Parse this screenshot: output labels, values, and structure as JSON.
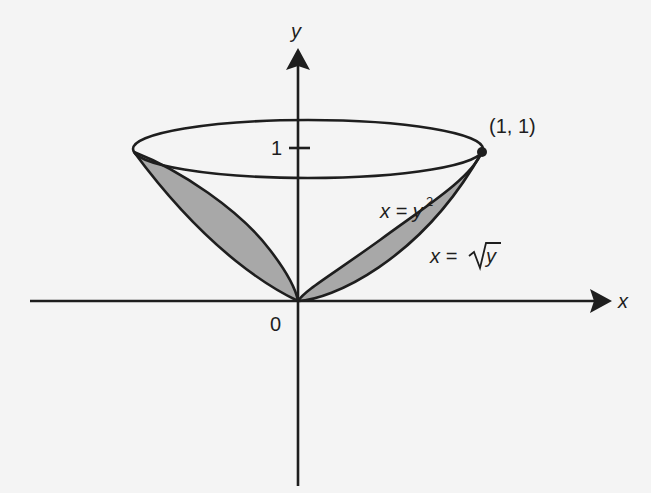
{
  "figure": {
    "colors": {
      "background": "#f4f4f4",
      "ink": "#1e1e1e",
      "shade": "#a8a8a8"
    },
    "axes": {
      "x_label": "x",
      "y_label": "y",
      "origin_label": "0",
      "y_tick_label": "1"
    },
    "labels": {
      "point": "(1, 1)",
      "curve_parabola": "x = y",
      "curve_parabola_exp": "2",
      "curve_sqrt_lhs": "x = ",
      "curve_sqrt_rad": "y"
    },
    "curves": [
      {
        "name": "parabola",
        "equation": "x = y^2"
      },
      {
        "name": "root",
        "equation": "x = sqrt(y)"
      }
    ],
    "marked_point": {
      "x": 1,
      "y": 1
    }
  }
}
